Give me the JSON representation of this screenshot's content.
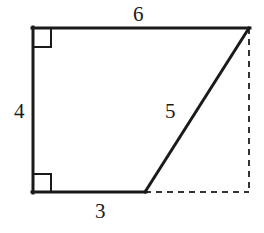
{
  "figure": {
    "stroke_color": "#1a1a1a",
    "dashed_color": "#333333",
    "background_color": "#ffffff",
    "solid_stroke_width": 3,
    "dashed_stroke_width": 2,
    "right_angle_marker_size": 18,
    "vertices": {
      "top_left": [
        33,
        28
      ],
      "top_right": [
        249,
        28
      ],
      "bottom_mid": [
        145,
        192
      ],
      "bottom_left": [
        33,
        192
      ],
      "bottom_right_virtual": [
        249,
        192
      ]
    },
    "edges": [
      {
        "name": "top-edge",
        "style": "solid",
        "from": [
          33,
          28
        ],
        "to": [
          249,
          28
        ],
        "label": "6"
      },
      {
        "name": "left-edge",
        "style": "solid",
        "from": [
          33,
          28
        ],
        "to": [
          33,
          192
        ],
        "label": "4"
      },
      {
        "name": "bottom-edge",
        "style": "solid",
        "from": [
          33,
          192
        ],
        "to": [
          145,
          192
        ],
        "label": "3"
      },
      {
        "name": "diagonal-edge",
        "style": "solid",
        "from": [
          145,
          192
        ],
        "to": [
          249,
          28
        ],
        "label": "5"
      },
      {
        "name": "right-dashed-edge",
        "style": "dashed",
        "from": [
          249,
          28
        ],
        "to": [
          249,
          192
        ],
        "label": ""
      },
      {
        "name": "bottom-dashed-edge",
        "style": "dashed",
        "from": [
          145,
          192
        ],
        "to": [
          249,
          192
        ],
        "label": ""
      }
    ],
    "right_angles": [
      {
        "name": "top-left-right-angle",
        "at": [
          33,
          28
        ],
        "corner": "top-left"
      },
      {
        "name": "bottom-left-right-angle",
        "at": [
          33,
          192
        ],
        "corner": "bottom-left"
      }
    ]
  },
  "labels": {
    "top": "6",
    "left": "4",
    "diagonal": "5",
    "bottom": "3"
  }
}
